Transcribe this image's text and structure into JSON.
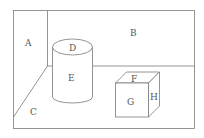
{
  "diagram": {
    "labels": {
      "A": "A",
      "B": "B",
      "C": "C",
      "D": "D",
      "E": "E",
      "F": "F",
      "G": "G",
      "H": "H"
    },
    "regions": [
      {
        "id": "A",
        "meaning": "left wall"
      },
      {
        "id": "B",
        "meaning": "back wall"
      },
      {
        "id": "C",
        "meaning": "floor"
      },
      {
        "id": "D",
        "meaning": "cylinder top"
      },
      {
        "id": "E",
        "meaning": "cylinder side"
      },
      {
        "id": "F",
        "meaning": "cube top face"
      },
      {
        "id": "G",
        "meaning": "cube front face"
      },
      {
        "id": "H",
        "meaning": "cube right face"
      }
    ],
    "colors": {
      "line": "#7a7a7a",
      "text": "#555555",
      "background": "#ffffff"
    }
  }
}
